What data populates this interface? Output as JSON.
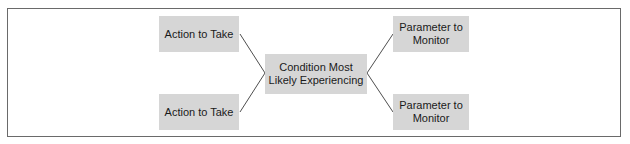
{
  "diagram": {
    "nodes": {
      "action_top": {
        "label": "Action to Take"
      },
      "action_bottom": {
        "label": "Action to Take"
      },
      "condition": {
        "label": "Condition Most\nLikely Experiencing"
      },
      "parameter_top": {
        "label": "Parameter to\nMonitor"
      },
      "parameter_bottom": {
        "label": "Parameter to\nMonitor"
      }
    },
    "edges": [
      {
        "from": "condition",
        "to": "action_top"
      },
      {
        "from": "condition",
        "to": "action_bottom"
      },
      {
        "from": "condition",
        "to": "parameter_top"
      },
      {
        "from": "condition",
        "to": "parameter_bottom"
      }
    ],
    "colors": {
      "box_fill": "#d6d6d6",
      "frame_border": "#6a6a6a",
      "connector": "#3a3a3a",
      "text": "#1a1a1a"
    }
  }
}
